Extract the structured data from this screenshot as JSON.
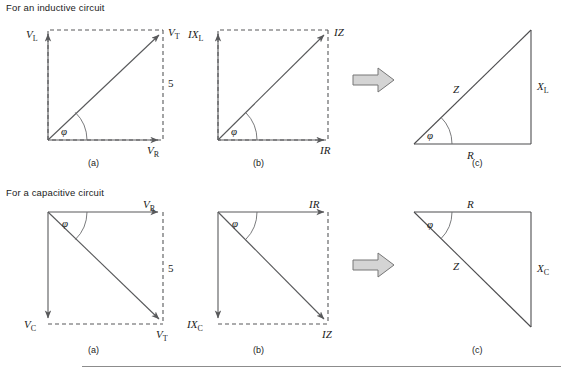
{
  "page": {
    "background": "#ffffff",
    "line_color": "#58595b",
    "text_color": "#1b1b1b",
    "block_arrow_fill": "#d4d4d4",
    "block_arrow_stroke": "#6e6e6e",
    "footer_rule_color": "#8c8c8c"
  },
  "sections": {
    "inductive": {
      "title": "For an inductive circuit",
      "step_number": "5",
      "panels": {
        "a": {
          "caption": "(a)",
          "labels": {
            "vertical": {
              "base": "V",
              "sub": "L"
            },
            "horizontal": {
              "base": "V",
              "sub": "R"
            },
            "resultant": {
              "base": "V",
              "sub": "T"
            },
            "angle": "φ"
          }
        },
        "b": {
          "caption": "(b)",
          "labels": {
            "vertical": {
              "base": "IX",
              "sub": "L"
            },
            "horizontal": {
              "base": "IR",
              "sub": ""
            },
            "resultant": {
              "base": "IZ",
              "sub": ""
            },
            "angle": "φ"
          }
        },
        "c": {
          "caption": "(c)",
          "labels": {
            "vertical": {
              "base": "X",
              "sub": "L"
            },
            "horizontal": {
              "base": "R",
              "sub": ""
            },
            "resultant": {
              "base": "Z",
              "sub": ""
            },
            "angle": "φ"
          }
        }
      }
    },
    "capacitive": {
      "title": "For a capacitive circuit",
      "step_number": "5",
      "panels": {
        "a": {
          "caption": "(a)",
          "labels": {
            "vertical": {
              "base": "V",
              "sub": "C"
            },
            "horizontal": {
              "base": "V",
              "sub": "R"
            },
            "resultant": {
              "base": "V",
              "sub": "T"
            },
            "angle": "φ"
          }
        },
        "b": {
          "caption": "(b)",
          "labels": {
            "vertical": {
              "base": "IX",
              "sub": "C"
            },
            "horizontal": {
              "base": "IR",
              "sub": ""
            },
            "resultant": {
              "base": "IZ",
              "sub": ""
            },
            "angle": "φ"
          }
        },
        "c": {
          "caption": "(c)",
          "labels": {
            "vertical": {
              "base": "X",
              "sub": "C"
            },
            "horizontal": {
              "base": "R",
              "sub": ""
            },
            "resultant": {
              "base": "Z",
              "sub": ""
            },
            "angle": "φ"
          }
        }
      }
    }
  }
}
